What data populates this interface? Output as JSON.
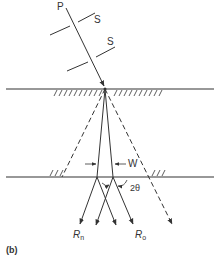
{
  "figure": {
    "caption": "(b)",
    "labels": {
      "incident_ray": "P",
      "slit_upper": "S",
      "slit_lower": "S",
      "width": "W",
      "angle": "2θ",
      "ray_n": {
        "main": "R",
        "sub": "n"
      },
      "ray_o": {
        "main": "R",
        "sub": "o"
      }
    },
    "colors": {
      "line": "#333333",
      "background": "#ffffff"
    }
  }
}
